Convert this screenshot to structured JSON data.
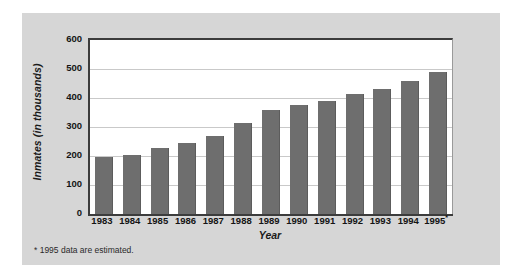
{
  "chart_data": {
    "type": "bar",
    "title": "",
    "xlabel": "Year",
    "ylabel": "Inmates (in thousands)",
    "categories": [
      "1983",
      "1984",
      "1985",
      "1986",
      "1987",
      "1988",
      "1989",
      "1990",
      "1991",
      "1992",
      "1993",
      "1994",
      "1995*"
    ],
    "values": [
      195,
      203,
      228,
      246,
      270,
      313,
      360,
      375,
      391,
      415,
      432,
      457,
      490
    ],
    "ylim": [
      0,
      600
    ],
    "ytick_labels": [
      "0",
      "100",
      "200",
      "300",
      "400",
      "500",
      "600"
    ],
    "ytick_values": [
      0,
      100,
      200,
      300,
      400,
      500,
      600
    ],
    "grid": true,
    "legend": null,
    "bar_color": "#6e6e6e",
    "plot_background": "#ffffff",
    "panel_background": "#d6d6d6",
    "axis_color": "#3c3c3c",
    "gridline_color": "#c9c9c9",
    "annotations": [
      {
        "name": "estimate-footnote",
        "text": "* 1995 data are estimated."
      }
    ]
  }
}
